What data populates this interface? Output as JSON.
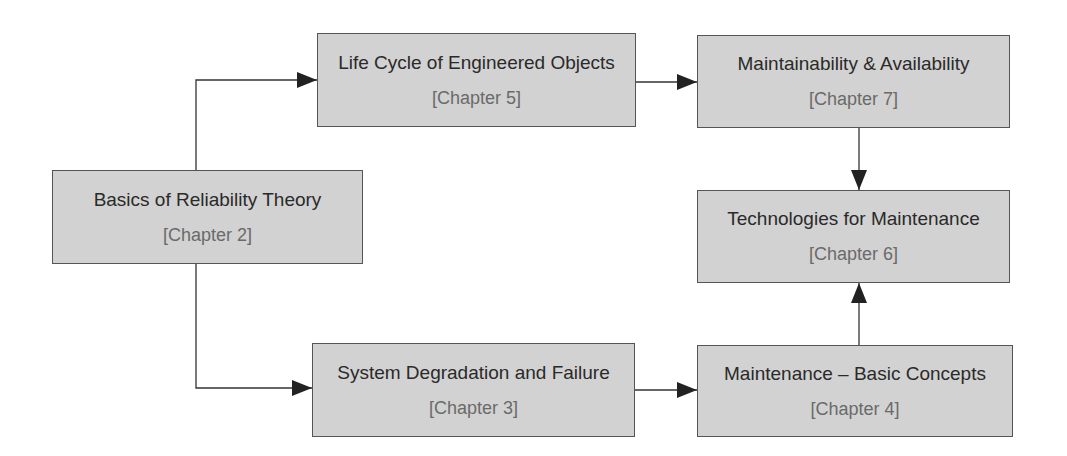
{
  "diagram": {
    "type": "flowchart",
    "nodes": [
      {
        "id": "basics",
        "title": "Basics of Reliability Theory",
        "chapter": "[Chapter 2]"
      },
      {
        "id": "lifecycle",
        "title": "Life Cycle of Engineered Objects",
        "chapter": "[Chapter 5]"
      },
      {
        "id": "maintainability",
        "title": "Maintainability & Availability",
        "chapter": "[Chapter 7]"
      },
      {
        "id": "technologies",
        "title": "Technologies for Maintenance",
        "chapter": "[Chapter 6]"
      },
      {
        "id": "degradation",
        "title": "System Degradation and Failure",
        "chapter": "[Chapter 3]"
      },
      {
        "id": "maintenance",
        "title": "Maintenance – Basic Concepts",
        "chapter": "[Chapter 4]"
      }
    ],
    "edges": [
      {
        "from": "basics",
        "to": "lifecycle"
      },
      {
        "from": "basics",
        "to": "degradation"
      },
      {
        "from": "lifecycle",
        "to": "maintainability"
      },
      {
        "from": "maintainability",
        "to": "technologies"
      },
      {
        "from": "degradation",
        "to": "maintenance"
      },
      {
        "from": "maintenance",
        "to": "technologies"
      }
    ],
    "colors": {
      "box_fill": "#d2d2d2",
      "box_border": "#555555",
      "arrow": "#222222"
    }
  }
}
